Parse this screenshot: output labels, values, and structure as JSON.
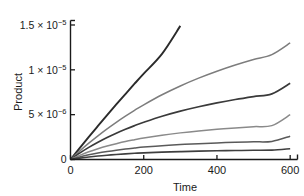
{
  "chart_data": {
    "type": "line",
    "title": "",
    "subtitle": "",
    "xlabel": "Time",
    "ylabel": "Product",
    "xlim": [
      0,
      620
    ],
    "ylim": [
      0,
      1.55e-05
    ],
    "grid": false,
    "legend": "none",
    "x_ticks": [
      {
        "value": 0,
        "label": "0"
      },
      {
        "value": 200,
        "label": "200"
      },
      {
        "value": 400,
        "label": "400"
      },
      {
        "value": 600,
        "label": "600"
      }
    ],
    "y_ticks": [
      {
        "value": 0,
        "label": "0",
        "mantissa": "0",
        "exponent": ""
      },
      {
        "value": 5e-06,
        "label": "5 × 10−6",
        "mantissa": "5 × 10",
        "exponent": "−6"
      },
      {
        "value": 1e-05,
        "label": "1 × 10−5",
        "mantissa": "1 × 10",
        "exponent": "−5"
      },
      {
        "value": 1.5e-05,
        "label": "1.5 × 10−5",
        "mantissa": "1.5 × 10",
        "exponent": "−5"
      }
    ],
    "x": [
      0,
      25,
      50,
      75,
      100,
      125,
      150,
      175,
      200,
      250,
      300,
      350,
      400,
      450,
      500,
      550,
      600
    ],
    "series": [
      {
        "name": "curve-1",
        "color": "#2b2b2b",
        "width": 1.9,
        "clipped_at_top": true,
        "note": "steepest, nearly linear, exits plot near Time = 305",
        "values": [
          0,
          1.27e-06,
          2.52e-06,
          3.74e-06,
          4.95e-06,
          6.14e-06,
          7.3e-06,
          8.45e-06,
          9.58e-06,
          1.178e-05,
          1.49e-05,
          null,
          null,
          null,
          null,
          null,
          null
        ]
      },
      {
        "name": "curve-2",
        "color": "#7d7d7d",
        "width": 1.5,
        "clipped_at_top": false,
        "values": [
          0,
          9.4e-07,
          1.82e-06,
          2.64e-06,
          3.42e-06,
          4.15e-06,
          4.84e-06,
          5.49e-06,
          6.1e-06,
          7.22e-06,
          8.2e-06,
          9.07e-06,
          9.84e-06,
          1.053e-05,
          1.115e-05,
          1.17e-05,
          1.3e-05
        ]
      },
      {
        "name": "curve-3",
        "color": "#3a3a3a",
        "width": 1.7,
        "clipped_at_top": false,
        "values": [
          0,
          7.1e-07,
          1.35e-06,
          1.92e-06,
          2.45e-06,
          2.93e-06,
          3.37e-06,
          3.78e-06,
          4.15e-06,
          4.82e-06,
          5.39e-06,
          5.88e-06,
          6.31e-06,
          6.69e-06,
          7.02e-06,
          7.32e-06,
          8.5e-06
        ]
      },
      {
        "name": "curve-4",
        "color": "#8a8a8a",
        "width": 1.5,
        "clipped_at_top": false,
        "values": [
          0,
          4.6e-07,
          8.6e-07,
          1.2e-06,
          1.5e-06,
          1.76e-06,
          2e-06,
          2.2e-06,
          2.39e-06,
          2.71e-06,
          2.97e-06,
          3.19e-06,
          3.37e-06,
          3.52e-06,
          3.66e-06,
          3.78e-06,
          5e-06
        ]
      },
      {
        "name": "curve-5",
        "color": "#5a5a5a",
        "width": 1.5,
        "clipped_at_top": false,
        "values": [
          0,
          2.8e-07,
          5.2e-07,
          7.2e-07,
          8.9e-07,
          1.04e-06,
          1.17e-06,
          1.28e-06,
          1.38e-06,
          1.54e-06,
          1.67e-06,
          1.77e-06,
          1.85e-06,
          1.92e-06,
          1.97e-06,
          2.02e-06,
          2.6e-06
        ]
      },
      {
        "name": "curve-6",
        "color": "#3f3f3f",
        "width": 1.6,
        "clipped_at_top": false,
        "values": [
          0,
          1.5e-07,
          2.8e-07,
          3.9e-07,
          4.8e-07,
          5.6e-07,
          6.3e-07,
          6.9e-07,
          7.4e-07,
          8.2e-07,
          8.8e-07,
          9.3e-07,
          9.7e-07,
          1e-06,
          1.03e-06,
          1.05e-06,
          1.2e-06
        ]
      }
    ]
  },
  "axes": {
    "y_label": "Product",
    "x_label": "Time"
  }
}
